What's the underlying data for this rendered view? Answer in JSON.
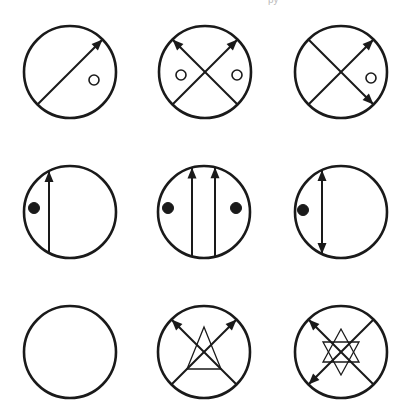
{
  "header": {
    "cut_off_text": "py"
  },
  "puzzle": {
    "type": "3x3 figure matrix",
    "stroke_color": "#1a1a1a",
    "background": "#ffffff",
    "radius": 46,
    "cells": [
      {
        "id": "r1c1",
        "cx": 70,
        "cy": 72,
        "lines": [
          {
            "from": "bottom-left",
            "to": "top-right",
            "heads": [
              "end"
            ]
          }
        ],
        "dots": [
          {
            "x": 24,
            "y": 8,
            "filled": false
          }
        ],
        "shape": null
      },
      {
        "id": "r1c2",
        "cx": 205,
        "cy": 72,
        "lines": [
          {
            "from": "bottom-left",
            "to": "top-right",
            "heads": [
              "end"
            ]
          },
          {
            "from": "bottom-right",
            "to": "top-left",
            "heads": [
              "end"
            ]
          }
        ],
        "dots": [
          {
            "x": -24,
            "y": 3,
            "filled": false
          },
          {
            "x": 32,
            "y": 3,
            "filled": false
          }
        ],
        "shape": null
      },
      {
        "id": "r1c3",
        "cx": 341,
        "cy": 72,
        "lines": [
          {
            "from": "bottom-left",
            "to": "top-right",
            "heads": [
              "end"
            ]
          },
          {
            "from": "top-left",
            "to": "bottom-right",
            "heads": [
              "end"
            ]
          }
        ],
        "dots": [
          {
            "x": 30,
            "y": 6,
            "filled": false
          }
        ],
        "shape": null
      },
      {
        "id": "r2c1",
        "cx": 70,
        "cy": 212,
        "lines": [
          {
            "from": "bottom",
            "to": "top",
            "heads": [
              "end"
            ],
            "xoff": -21
          }
        ],
        "dots": [
          {
            "x": -36,
            "y": -4,
            "filled": true
          }
        ],
        "shape": null
      },
      {
        "id": "r2c2",
        "cx": 204,
        "cy": 212,
        "lines": [
          {
            "from": "bottom",
            "to": "top",
            "heads": [
              "end"
            ],
            "xoff": -12
          },
          {
            "from": "bottom",
            "to": "top",
            "heads": [
              "end"
            ],
            "xoff": 11
          }
        ],
        "dots": [
          {
            "x": -36,
            "y": -4,
            "filled": true
          },
          {
            "x": 32,
            "y": -4,
            "filled": true
          }
        ],
        "shape": null
      },
      {
        "id": "r2c3",
        "cx": 341,
        "cy": 212,
        "lines": [
          {
            "from": "bottom",
            "to": "top",
            "heads": [
              "start",
              "end"
            ],
            "xoff": -19
          }
        ],
        "dots": [
          {
            "x": -38,
            "y": -2,
            "filled": true
          }
        ],
        "shape": null
      },
      {
        "id": "r3c1",
        "cx": 70,
        "cy": 352,
        "lines": [],
        "dots": [],
        "shape": null
      },
      {
        "id": "r3c2",
        "cx": 204,
        "cy": 352,
        "lines": [
          {
            "from": "bottom-left",
            "to": "top-right",
            "heads": [
              "end"
            ]
          },
          {
            "from": "bottom-right",
            "to": "top-left",
            "heads": [
              "end"
            ]
          }
        ],
        "dots": [],
        "shape": "triangle"
      },
      {
        "id": "r3c3",
        "cx": 341,
        "cy": 352,
        "lines": [
          {
            "from": "bottom-right",
            "to": "top-left",
            "heads": [
              "end"
            ]
          },
          {
            "from": "top-right",
            "to": "bottom-left",
            "heads": [
              "end"
            ]
          }
        ],
        "dots": [],
        "shape": "hexagram"
      }
    ]
  }
}
